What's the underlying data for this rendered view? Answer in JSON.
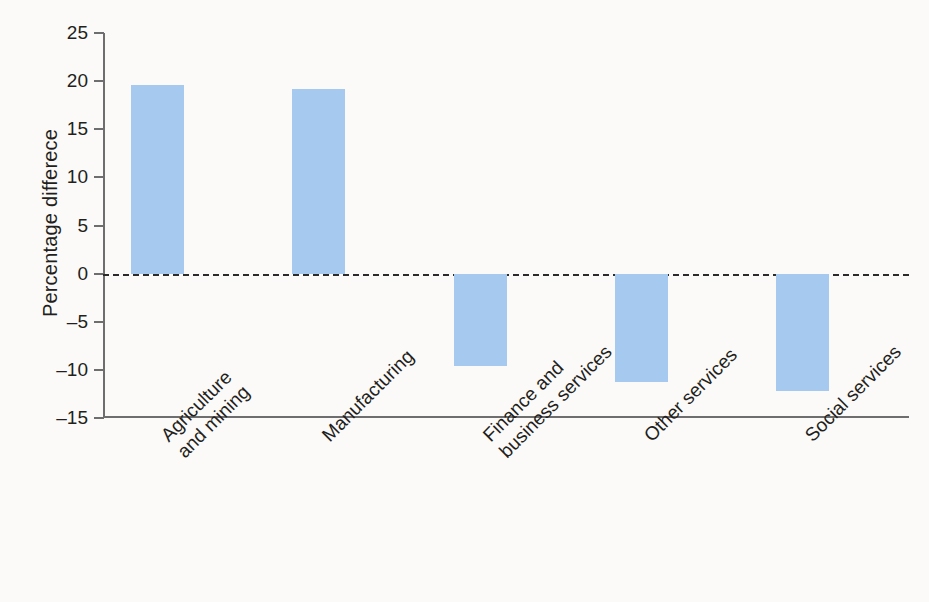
{
  "chart_data": {
    "type": "bar",
    "title": "",
    "subtitle": "",
    "xlabel": "",
    "ylabel": "Percentage differece",
    "categories": [
      "Agriculture and mining",
      "Manufacturing",
      "Finance and business services",
      "Other services",
      "Social services"
    ],
    "category_lines": [
      [
        "Agriculture",
        "and mining"
      ],
      [
        "Manufacturing"
      ],
      [
        "Finance and",
        "business services"
      ],
      [
        "Other services"
      ],
      [
        "Social services"
      ]
    ],
    "values": [
      19.6,
      19.2,
      -9.6,
      -11.3,
      -12.2
    ],
    "ylim": [
      -15,
      25
    ],
    "yticks": [
      25,
      20,
      15,
      10,
      5,
      0,
      -5,
      -10,
      -15
    ],
    "ytick_labels": [
      "25",
      "20",
      "15",
      "10",
      "5",
      "0",
      "–5",
      "–10",
      "–15"
    ],
    "grid": false,
    "legend": false,
    "zero_line": true,
    "zero_line_style": "dashed",
    "bar_color": "#a6c9ef",
    "axis_color": "#6e6e6e",
    "text_color": "#231f20",
    "background_color": "#fbfaf8"
  }
}
